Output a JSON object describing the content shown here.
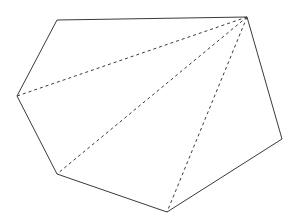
{
  "figure": {
    "canvas": {
      "width": 298,
      "height": 223
    },
    "background_color": "#ffffff",
    "stroke_color": "#3a3a3a",
    "stroke_width": 1,
    "dash_pattern": "3 3"
  },
  "chart_data": {
    "type": "diagram",
    "shape": "hexagon",
    "vertex_count": 6,
    "vertices": [
      {
        "label": "A",
        "x": 57,
        "y": 20
      },
      {
        "label": "B",
        "x": 247,
        "y": 17
      },
      {
        "label": "C",
        "x": 282,
        "y": 139
      },
      {
        "label": "D",
        "x": 167,
        "y": 212
      },
      {
        "label": "E",
        "x": 57,
        "y": 174
      },
      {
        "label": "F",
        "x": 17,
        "y": 96
      }
    ],
    "edges": [
      {
        "from": "A",
        "to": "B",
        "style": "solid"
      },
      {
        "from": "B",
        "to": "C",
        "style": "solid"
      },
      {
        "from": "C",
        "to": "D",
        "style": "solid"
      },
      {
        "from": "D",
        "to": "E",
        "style": "solid"
      },
      {
        "from": "E",
        "to": "F",
        "style": "solid"
      },
      {
        "from": "F",
        "to": "A",
        "style": "solid"
      }
    ],
    "diagonals": [
      {
        "from": "B",
        "to": "F",
        "style": "dashed"
      },
      {
        "from": "B",
        "to": "E",
        "style": "dashed"
      },
      {
        "from": "B",
        "to": "D",
        "style": "dashed"
      }
    ],
    "apex_vertex": "B",
    "triangle_count": 4,
    "legend": [],
    "annotations": [],
    "grid": false
  },
  "paths": {
    "polygon_outline": "M 57,20 L 247,17 L 282,139 L 167,212 L 57,174 L 17,96 Z",
    "diagonal_to_f": "M 247,17 L 17,96",
    "diagonal_to_e": "M 247,17 L 57,174",
    "diagonal_to_d": "M 247,17 L 167,212"
  }
}
